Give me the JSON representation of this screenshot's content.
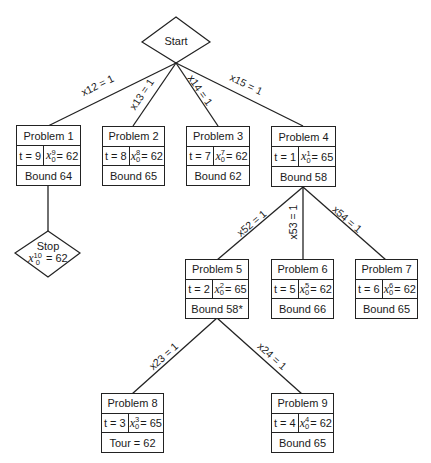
{
  "start": {
    "label": "Start"
  },
  "stop": {
    "label": "Stop",
    "var": "x",
    "sup": "10",
    "sub": "0",
    "value": "= 62"
  },
  "nodes": [
    {
      "title": "Problem 1",
      "t": "t = 9",
      "sup": "9",
      "sub": "0",
      "xval": "= 62",
      "bottom": "Bound 64"
    },
    {
      "title": "Problem 2",
      "t": "t = 8",
      "sup": "8",
      "sub": "0",
      "xval": "= 62",
      "bottom": "Bound 65"
    },
    {
      "title": "Problem 3",
      "t": "t = 7",
      "sup": "7",
      "sub": "0",
      "xval": "= 62",
      "bottom": "Bound 62"
    },
    {
      "title": "Problem 4",
      "t": "t = 1",
      "sup": "1",
      "sub": "0",
      "xval": "= 65",
      "bottom": "Bound 58"
    },
    {
      "title": "Problem 5",
      "t": "t = 2",
      "sup": "2",
      "sub": "0",
      "xval": "= 65",
      "bottom": "Bound 58*"
    },
    {
      "title": "Problem 6",
      "t": "t = 5",
      "sup": "5",
      "sub": "0",
      "xval": "= 62",
      "bottom": "Bound 66"
    },
    {
      "title": "Problem 7",
      "t": "t = 6",
      "sup": "6",
      "sub": "0",
      "xval": "= 62",
      "bottom": "Bound 65"
    },
    {
      "title": "Problem 8",
      "t": "t = 3",
      "sup": "3",
      "sub": "0",
      "xval": "= 65",
      "bottom": "Tour = 62"
    },
    {
      "title": "Problem 9",
      "t": "t = 4",
      "sup": "4",
      "sub": "0",
      "xval": "= 62",
      "bottom": "Bound 65"
    }
  ],
  "edges": [
    {
      "label": "x12 = 1"
    },
    {
      "label": "x13 = 1"
    },
    {
      "label": "x14 = 1"
    },
    {
      "label": "x15 = 1"
    },
    {
      "label": "x52 = 1"
    },
    {
      "label": "x53 = 1"
    },
    {
      "label": "x54 = 1"
    },
    {
      "label": "x23 = 1"
    },
    {
      "label": "x24 = 1"
    }
  ],
  "var_symbol": "x"
}
